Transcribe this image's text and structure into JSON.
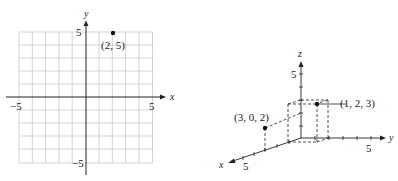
{
  "plot2d": {
    "x_axis_label": "x",
    "y_axis_label": "y",
    "tick_neg_x": "−5",
    "tick_pos_x": "5",
    "tick_pos_y": "5",
    "tick_neg_y": "−5",
    "point_label": "(2, 5)",
    "grid_range": [
      -5,
      5
    ]
  },
  "plot3d": {
    "x_axis_label": "x",
    "y_axis_label": "y",
    "z_axis_label": "z",
    "tick_x": "5",
    "tick_y": "5",
    "tick_z": "5",
    "point_a_label": "(3, 0, 2)",
    "point_b_label": "(1, 2, 3)"
  },
  "colors": {
    "ink": "#222222",
    "grid": "#c8c8c8"
  }
}
